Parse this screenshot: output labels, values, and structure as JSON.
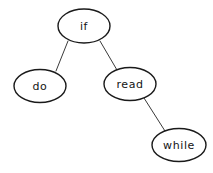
{
  "diagram": {
    "type": "binary-tree",
    "background_color": "#ffffff",
    "node_fill_color": "#ffffff",
    "node_stroke_color": "#1a1a1a",
    "edge_stroke_color": "#3a3a3a",
    "label_color": "#141414",
    "nodes": [
      {
        "id": "if",
        "label": "if",
        "role": "root",
        "cx": 84,
        "cy": 26,
        "rx": 26,
        "ry": 17
      },
      {
        "id": "do",
        "label": "do",
        "role": "left-child-of-if",
        "cx": 40,
        "cy": 86,
        "rx": 26,
        "ry": 16.5
      },
      {
        "id": "read",
        "label": "read",
        "role": "right-child-of-if",
        "cx": 130,
        "cy": 84,
        "rx": 26,
        "ry": 16.5
      },
      {
        "id": "while",
        "label": "while",
        "role": "right-child-of-read",
        "cx": 179,
        "cy": 145,
        "rx": 27,
        "ry": 16.5
      }
    ],
    "edges": [
      {
        "id": "if-do",
        "from": "if",
        "to": "do",
        "x1": 68,
        "y1": 41,
        "x2": 56,
        "y2": 71
      },
      {
        "id": "if-read",
        "from": "if",
        "to": "read",
        "x1": 100,
        "y1": 41,
        "x2": 117,
        "y2": 70
      },
      {
        "id": "read-while",
        "from": "read",
        "to": "while",
        "x1": 144,
        "y1": 98,
        "x2": 165,
        "y2": 131
      }
    ]
  }
}
